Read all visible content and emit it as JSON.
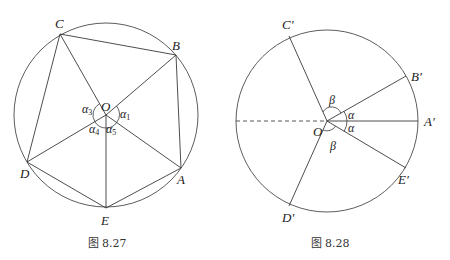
{
  "figures": [
    {
      "caption": "图 8.27",
      "center_label": "O",
      "vertices": {
        "A": "A",
        "B": "B",
        "C": "C",
        "D": "D",
        "E": "E"
      },
      "angles": {
        "a1": "α",
        "a1_sub": "1",
        "a3": "α",
        "a3_sub": "3",
        "a4": "α",
        "a4_sub": "4",
        "a5": "α",
        "a5_sub": "5"
      }
    },
    {
      "caption": "图 8.28",
      "center_label": "O",
      "vertices": {
        "A": "A′",
        "B": "B′",
        "C": "C′",
        "D": "D′",
        "E": "E′"
      },
      "angles": {
        "alpha_top": "α",
        "alpha_bottom": "α",
        "beta_top": "β",
        "beta_bottom": "β"
      }
    }
  ]
}
